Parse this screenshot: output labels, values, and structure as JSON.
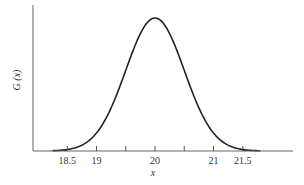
{
  "chart_data": {
    "type": "line",
    "title": "",
    "xlabel": "x",
    "ylabel": "G (x)",
    "distribution": "normal",
    "mean": 20,
    "std_dev": 0.5,
    "x_tick_labels": [
      "18.5",
      "19",
      "20",
      "21",
      "21.5"
    ],
    "x_ticks_all": [
      18.5,
      19,
      19.5,
      20,
      20.5,
      21,
      21.5
    ],
    "shaded_regions": [
      {
        "from": 18.2,
        "to": 18.5,
        "label": "lower tail"
      },
      {
        "from": 21.5,
        "to": 21.8,
        "label": "upper tail"
      }
    ],
    "xlim": [
      17.8,
      22.3
    ],
    "y_ticks": [],
    "grid": false,
    "legend": "none"
  },
  "layout": {
    "origin_px": [
      33,
      151
    ],
    "px_per_unit_x": 58.5,
    "peak_height_px": 133,
    "curve_color": "#222222",
    "shade_color": "#111111",
    "axis_color": "#555555"
  }
}
